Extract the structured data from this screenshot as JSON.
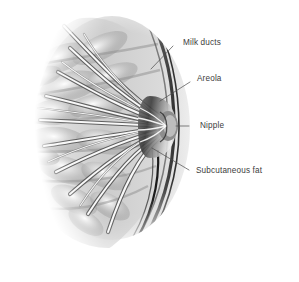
{
  "figure": {
    "name": "breast-anatomy-cross-section",
    "background_color": "#ffffff",
    "width": 299,
    "height": 282,
    "style": "grayscale medical illustration"
  },
  "labels": [
    {
      "id": "milk-ducts",
      "text": "Milk ducts",
      "text_x": 183,
      "text_y": 43,
      "leader": {
        "x1": 173,
        "y1": 46,
        "x2": 151,
        "y2": 69
      },
      "color": "#3c3c3c"
    },
    {
      "id": "areola",
      "text": "Areola",
      "text_x": 197,
      "text_y": 79,
      "leader": {
        "x1": 190,
        "y1": 82,
        "x2": 160,
        "y2": 101
      },
      "color": "#3c3c3c"
    },
    {
      "id": "nipple",
      "text": "Nipple",
      "text_x": 200,
      "text_y": 126,
      "leader": {
        "x1": 189,
        "y1": 126,
        "x2": 176,
        "y2": 126
      },
      "color": "#3c3c3c"
    },
    {
      "id": "subcutaneous-fat",
      "text": "Subcutaneous fat",
      "text_x": 196,
      "text_y": 171,
      "leader": {
        "x1": 189,
        "y1": 170,
        "x2": 152,
        "y2": 148
      },
      "color": "#3c3c3c"
    }
  ],
  "illustration": {
    "tissue_tone_light": "#f2f2f2",
    "tissue_tone_mid": "#c9c9c9",
    "tissue_tone_dark": "#7a7a7a",
    "contour_dark": "#2a2a2a",
    "duct_highlight": "#ffffff",
    "nipple_center_x": 168,
    "nipple_center_y": 126
  }
}
